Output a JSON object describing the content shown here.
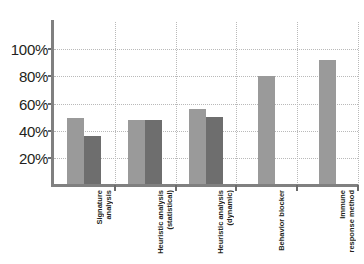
{
  "chart_data": {
    "type": "bar",
    "title": "",
    "subtitle": "",
    "xlabel": "",
    "ylabel": "",
    "ylim": [
      0,
      120
    ],
    "ytick_values": [
      20,
      40,
      60,
      80,
      100
    ],
    "ytick_labels": [
      "20%",
      "40%",
      "60%",
      "80%",
      "100%"
    ],
    "grid": true,
    "legend": "none",
    "value_suffix": "%",
    "categories": [
      "Signature analysis",
      "Heuristic analysis (statistical)",
      "Heuristic analysis (dynamic)",
      "Behavior blocker",
      "Immune response method"
    ],
    "category_label_lines": [
      [
        "Signature",
        "analysis"
      ],
      [
        "Heuristic analysis",
        "(statistical)"
      ],
      [
        "Heuristic analysis",
        "(dynamic)"
      ],
      [
        "Behavior blocker"
      ],
      [
        "Immune",
        "response method"
      ]
    ],
    "series": [
      {
        "name": "series-light",
        "color": "#9a9a9a",
        "values": [
          49,
          48,
          56,
          80,
          92
        ]
      },
      {
        "name": "series-dark",
        "color": "#6e6e6e",
        "values": [
          36,
          48,
          50,
          null,
          null
        ]
      }
    ],
    "colors": {
      "series_light": "#9a9a9a",
      "series_dark": "#6e6e6e",
      "axis": "#808080",
      "gridline": "#b9b9b9",
      "text": "#231f20",
      "background": "#ffffff"
    }
  }
}
